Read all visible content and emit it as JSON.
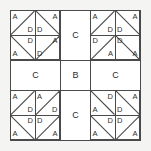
{
  "diagram": {
    "colors": {
      "line": "#4a4a4a",
      "text": "#2b2b2b",
      "fill": "#ffffff",
      "page": "#f4f4f2"
    },
    "grid": {
      "columns": 3,
      "rows": 3
    },
    "cells": [
      {
        "position": "top-left",
        "type": "hst-block",
        "units": [
          {
            "position": "top-left",
            "diagonal": "bl-tr",
            "labels": [
              {
                "corner": "tl",
                "text": "A"
              },
              {
                "corner": "br",
                "text": "D"
              }
            ]
          },
          {
            "position": "top-right",
            "diagonal": "tl-br",
            "labels": [
              {
                "corner": "bl",
                "text": "D"
              },
              {
                "corner": "tr",
                "text": "A"
              }
            ]
          },
          {
            "position": "bottom-left",
            "diagonal": "tl-br",
            "labels": [
              {
                "corner": "tr",
                "text": "D"
              },
              {
                "corner": "bl",
                "text": "A"
              }
            ]
          },
          {
            "position": "bottom-right",
            "diagonal": "bl-tr",
            "labels": [
              {
                "corner": "tr",
                "text": "A"
              },
              {
                "corner": "bl",
                "text": "D"
              }
            ]
          }
        ]
      },
      {
        "position": "top-center",
        "type": "plain",
        "label": "C"
      },
      {
        "position": "top-right",
        "type": "hst-block",
        "units": [
          {
            "position": "top-left",
            "diagonal": "bl-tr",
            "labels": [
              {
                "corner": "tl",
                "text": "A"
              },
              {
                "corner": "br",
                "text": "D"
              }
            ]
          },
          {
            "position": "top-right",
            "diagonal": "tl-br",
            "labels": [
              {
                "corner": "bl",
                "text": "D"
              },
              {
                "corner": "tr",
                "text": "A"
              }
            ]
          },
          {
            "position": "bottom-left",
            "diagonal": "bl-tr",
            "labels": [
              {
                "corner": "tl",
                "text": "D"
              },
              {
                "corner": "br",
                "text": "A"
              }
            ]
          },
          {
            "position": "bottom-right",
            "diagonal": "tl-br",
            "labels": [
              {
                "corner": "tl",
                "text": "D"
              },
              {
                "corner": "br",
                "text": "A"
              }
            ]
          }
        ]
      },
      {
        "position": "middle-left",
        "type": "plain",
        "label": "C"
      },
      {
        "position": "middle-center",
        "type": "plain",
        "label": "B"
      },
      {
        "position": "middle-right",
        "type": "plain",
        "label": "C"
      },
      {
        "position": "bottom-left",
        "type": "hst-block",
        "units": [
          {
            "position": "top-left",
            "diagonal": "bl-tr",
            "labels": [
              {
                "corner": "tl",
                "text": "A"
              },
              {
                "corner": "br",
                "text": "D"
              }
            ]
          },
          {
            "position": "top-right",
            "diagonal": "bl-tr",
            "labels": [
              {
                "corner": "tl",
                "text": "A"
              },
              {
                "corner": "br",
                "text": "D"
              }
            ]
          },
          {
            "position": "bottom-left",
            "diagonal": "tl-br",
            "labels": [
              {
                "corner": "tr",
                "text": "D"
              },
              {
                "corner": "bl",
                "text": "A"
              }
            ]
          },
          {
            "position": "bottom-right",
            "diagonal": "bl-tr",
            "labels": [
              {
                "corner": "tl",
                "text": "D"
              },
              {
                "corner": "br",
                "text": "A"
              }
            ]
          }
        ]
      },
      {
        "position": "bottom-center",
        "type": "plain",
        "label": "C"
      },
      {
        "position": "bottom-right",
        "type": "hst-block",
        "units": [
          {
            "position": "top-left",
            "diagonal": "tl-br",
            "labels": [
              {
                "corner": "tr",
                "text": "D"
              },
              {
                "corner": "bl",
                "text": "A"
              }
            ]
          },
          {
            "position": "top-right",
            "diagonal": "tl-br",
            "labels": [
              {
                "corner": "bl",
                "text": "D"
              },
              {
                "corner": "tr",
                "text": "A"
              }
            ]
          },
          {
            "position": "bottom-left",
            "diagonal": "tl-br",
            "labels": [
              {
                "corner": "tr",
                "text": "D"
              },
              {
                "corner": "bl",
                "text": "A"
              }
            ]
          },
          {
            "position": "bottom-right",
            "diagonal": "bl-tr",
            "labels": [
              {
                "corner": "tl",
                "text": "D"
              },
              {
                "corner": "br",
                "text": "A"
              }
            ]
          }
        ]
      }
    ]
  }
}
